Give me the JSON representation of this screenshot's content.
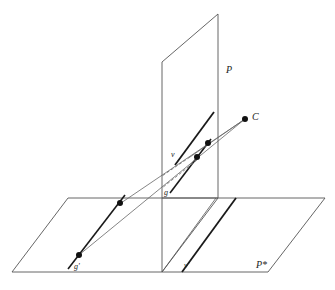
{
  "diagram": {
    "labels": {
      "picture_plane": "P",
      "ground_plane": "P*",
      "center": "C",
      "line_g": "g",
      "line_v": "v",
      "line_g_prime": "g'",
      "line_v_prime": "v'"
    },
    "colors": {
      "plane_edge": "#555555",
      "thick_line": "#1a1a1a",
      "thin_line": "#666666",
      "point": "#111111",
      "background": "#ffffff"
    }
  }
}
